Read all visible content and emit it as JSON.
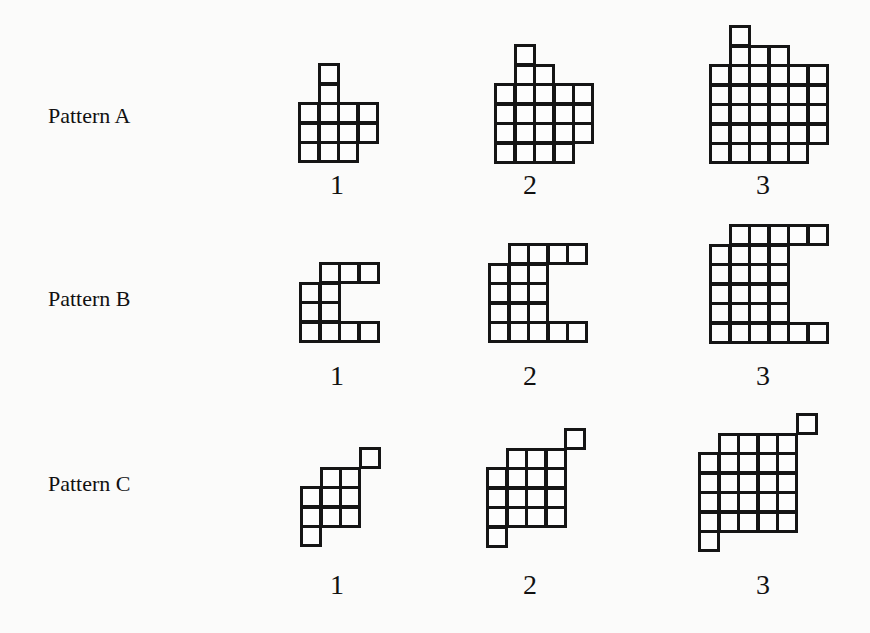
{
  "cell_size": 19,
  "rows": [
    {
      "label": "Pattern A",
      "label_pos": {
        "x": 48,
        "y": 104
      },
      "steps": [
        {
          "number": "1",
          "num_pos": {
            "x": 317,
            "y": 170
          },
          "origin": {
            "x": 298,
            "y": 63
          },
          "cells": [
            [
              1,
              0
            ],
            [
              1,
              1
            ],
            [
              0,
              2
            ],
            [
              1,
              2
            ],
            [
              2,
              2
            ],
            [
              3,
              2
            ],
            [
              0,
              3
            ],
            [
              1,
              3
            ],
            [
              2,
              3
            ],
            [
              3,
              3
            ],
            [
              0,
              4
            ],
            [
              1,
              4
            ],
            [
              2,
              4
            ]
          ]
        },
        {
          "number": "2",
          "num_pos": {
            "x": 510,
            "y": 170
          },
          "origin": {
            "x": 494,
            "y": 44
          },
          "cells": [
            [
              1,
              0
            ],
            [
              1,
              1
            ],
            [
              2,
              1
            ],
            [
              0,
              2
            ],
            [
              1,
              2
            ],
            [
              2,
              2
            ],
            [
              3,
              2
            ],
            [
              4,
              2
            ],
            [
              0,
              3
            ],
            [
              1,
              3
            ],
            [
              2,
              3
            ],
            [
              3,
              3
            ],
            [
              4,
              3
            ],
            [
              0,
              4
            ],
            [
              1,
              4
            ],
            [
              2,
              4
            ],
            [
              3,
              4
            ],
            [
              4,
              4
            ],
            [
              0,
              5
            ],
            [
              1,
              5
            ],
            [
              2,
              5
            ],
            [
              3,
              5
            ]
          ]
        },
        {
          "number": "3",
          "num_pos": {
            "x": 743,
            "y": 170
          },
          "origin": {
            "x": 709,
            "y": 25
          },
          "cells": [
            [
              1,
              0
            ],
            [
              1,
              1
            ],
            [
              2,
              1
            ],
            [
              3,
              1
            ],
            [
              0,
              2
            ],
            [
              1,
              2
            ],
            [
              2,
              2
            ],
            [
              3,
              2
            ],
            [
              4,
              2
            ],
            [
              5,
              2
            ],
            [
              0,
              3
            ],
            [
              1,
              3
            ],
            [
              2,
              3
            ],
            [
              3,
              3
            ],
            [
              4,
              3
            ],
            [
              5,
              3
            ],
            [
              0,
              4
            ],
            [
              1,
              4
            ],
            [
              2,
              4
            ],
            [
              3,
              4
            ],
            [
              4,
              4
            ],
            [
              5,
              4
            ],
            [
              0,
              5
            ],
            [
              1,
              5
            ],
            [
              2,
              5
            ],
            [
              3,
              5
            ],
            [
              4,
              5
            ],
            [
              5,
              5
            ],
            [
              0,
              6
            ],
            [
              1,
              6
            ],
            [
              2,
              6
            ],
            [
              3,
              6
            ],
            [
              4,
              6
            ]
          ]
        }
      ]
    },
    {
      "label": "Pattern B",
      "label_pos": {
        "x": 48,
        "y": 287
      },
      "steps": [
        {
          "number": "1",
          "num_pos": {
            "x": 317,
            "y": 361
          },
          "origin": {
            "x": 299,
            "y": 262
          },
          "cells": [
            [
              1,
              0
            ],
            [
              2,
              0
            ],
            [
              3,
              0
            ],
            [
              0,
              1
            ],
            [
              1,
              1
            ],
            [
              0,
              2
            ],
            [
              1,
              2
            ],
            [
              0,
              3
            ],
            [
              1,
              3
            ],
            [
              2,
              3
            ],
            [
              3,
              3
            ]
          ]
        },
        {
          "number": "2",
          "num_pos": {
            "x": 510,
            "y": 361
          },
          "origin": {
            "x": 488,
            "y": 243
          },
          "cells": [
            [
              1,
              0
            ],
            [
              2,
              0
            ],
            [
              3,
              0
            ],
            [
              4,
              0
            ],
            [
              0,
              1
            ],
            [
              1,
              1
            ],
            [
              2,
              1
            ],
            [
              0,
              2
            ],
            [
              1,
              2
            ],
            [
              2,
              2
            ],
            [
              0,
              3
            ],
            [
              1,
              3
            ],
            [
              2,
              3
            ],
            [
              0,
              4
            ],
            [
              1,
              4
            ],
            [
              2,
              4
            ],
            [
              3,
              4
            ],
            [
              4,
              4
            ]
          ]
        },
        {
          "number": "3",
          "num_pos": {
            "x": 743,
            "y": 361
          },
          "origin": {
            "x": 709,
            "y": 224
          },
          "cells": [
            [
              1,
              0
            ],
            [
              2,
              0
            ],
            [
              3,
              0
            ],
            [
              4,
              0
            ],
            [
              5,
              0
            ],
            [
              0,
              1
            ],
            [
              1,
              1
            ],
            [
              2,
              1
            ],
            [
              3,
              1
            ],
            [
              0,
              2
            ],
            [
              1,
              2
            ],
            [
              2,
              2
            ],
            [
              3,
              2
            ],
            [
              0,
              3
            ],
            [
              1,
              3
            ],
            [
              2,
              3
            ],
            [
              3,
              3
            ],
            [
              0,
              4
            ],
            [
              1,
              4
            ],
            [
              2,
              4
            ],
            [
              3,
              4
            ],
            [
              0,
              5
            ],
            [
              1,
              5
            ],
            [
              2,
              5
            ],
            [
              3,
              5
            ],
            [
              4,
              5
            ],
            [
              5,
              5
            ]
          ]
        }
      ]
    },
    {
      "label": "Pattern C",
      "label_pos": {
        "x": 48,
        "y": 472
      },
      "steps": [
        {
          "number": "1",
          "num_pos": {
            "x": 317,
            "y": 570
          },
          "origin": {
            "x": 300,
            "y": 447
          },
          "cells": [
            [
              3,
              0
            ],
            [
              1,
              1
            ],
            [
              2,
              1
            ],
            [
              0,
              2
            ],
            [
              1,
              2
            ],
            [
              2,
              2
            ],
            [
              0,
              3
            ],
            [
              1,
              3
            ],
            [
              2,
              3
            ],
            [
              0,
              4
            ]
          ]
        },
        {
          "number": "2",
          "num_pos": {
            "x": 510,
            "y": 570
          },
          "origin": {
            "x": 486,
            "y": 428
          },
          "cells": [
            [
              4,
              0
            ],
            [
              1,
              1
            ],
            [
              2,
              1
            ],
            [
              3,
              1
            ],
            [
              0,
              2
            ],
            [
              1,
              2
            ],
            [
              2,
              2
            ],
            [
              3,
              2
            ],
            [
              0,
              3
            ],
            [
              1,
              3
            ],
            [
              2,
              3
            ],
            [
              3,
              3
            ],
            [
              0,
              4
            ],
            [
              1,
              4
            ],
            [
              2,
              4
            ],
            [
              3,
              4
            ],
            [
              0,
              5
            ]
          ]
        },
        {
          "number": "3",
          "num_pos": {
            "x": 743,
            "y": 570
          },
          "origin": {
            "x": 698,
            "y": 413
          },
          "cells": [
            [
              5,
              0
            ],
            [
              1,
              1
            ],
            [
              2,
              1
            ],
            [
              3,
              1
            ],
            [
              4,
              1
            ],
            [
              0,
              2
            ],
            [
              1,
              2
            ],
            [
              2,
              2
            ],
            [
              3,
              2
            ],
            [
              4,
              2
            ],
            [
              0,
              3
            ],
            [
              1,
              3
            ],
            [
              2,
              3
            ],
            [
              3,
              3
            ],
            [
              4,
              3
            ],
            [
              0,
              4
            ],
            [
              1,
              4
            ],
            [
              2,
              4
            ],
            [
              3,
              4
            ],
            [
              4,
              4
            ],
            [
              0,
              5
            ],
            [
              1,
              5
            ],
            [
              2,
              5
            ],
            [
              3,
              5
            ],
            [
              4,
              5
            ],
            [
              0,
              6
            ]
          ]
        }
      ]
    }
  ]
}
